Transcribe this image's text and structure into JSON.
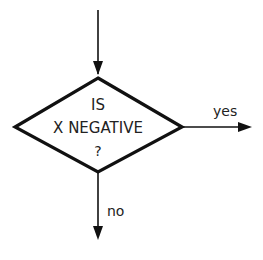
{
  "diagram": {
    "type": "flowchart-decision",
    "decision": {
      "line1": "IS",
      "line2": "X NEGATIVE",
      "line3": "?"
    },
    "branches": {
      "yes_label": "yes",
      "no_label": "no"
    },
    "colors": {
      "stroke": "#111111",
      "text": "#222222",
      "background": "#ffffff"
    }
  }
}
